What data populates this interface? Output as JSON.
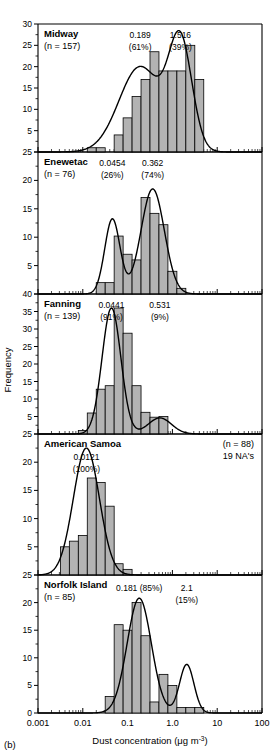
{
  "figure": {
    "label": "(b)",
    "xaxis_title_main": "Dust concentration (",
    "xaxis_title_unit": "μg m",
    "xaxis_title_sup": "-3",
    "xaxis_title_close": ")",
    "yaxis_title": "Frequency",
    "x_tick_labels": [
      "0.001",
      "0.01",
      "0.1",
      "1.0",
      "10",
      "100"
    ],
    "x_tick_values": [
      0.001,
      0.01,
      0.1,
      1.0,
      10,
      100
    ]
  },
  "chart_data": [
    {
      "type": "bar",
      "title": "Midway",
      "n_label": "(n = 157)",
      "n": 157,
      "xlabel": "Dust concentration (μg m-3)",
      "ylabel": "Frequency",
      "ylim": [
        0,
        30
      ],
      "y_ticks": [
        0,
        5,
        10,
        15,
        20,
        25,
        30
      ],
      "y_tick_labels": [
        "",
        "5",
        "10",
        "15",
        "20",
        "25",
        "30"
      ],
      "xlim_log10": [
        -3,
        2
      ],
      "xscale": "log",
      "grid": false,
      "bin_edges_log10": [
        -1.9,
        -1.7,
        -1.5,
        -1.3,
        -1.1,
        -0.9,
        -0.7,
        -0.5,
        -0.3,
        -0.1,
        0.1,
        0.3,
        0.5,
        0.7
      ],
      "values": [
        1,
        1,
        0,
        4,
        8,
        13,
        17,
        23.5,
        19,
        19,
        19,
        25,
        17,
        9
      ],
      "annotations": [
        {
          "value": "0.189",
          "percent": "(61%)",
          "at_log10": -0.72
        },
        {
          "value": "1.516",
          "percent": "(39%)",
          "at_log10": 0.18
        }
      ],
      "curve_modes": [
        {
          "center_log10": -0.72,
          "weight": 0.61,
          "sigma": 0.47,
          "peak": 20
        },
        {
          "center_log10": 0.18,
          "weight": 0.39,
          "sigma": 0.26,
          "peak": 25
        }
      ]
    },
    {
      "type": "bar",
      "title": "Enewetac",
      "n_label": "(n = 76)",
      "n": 76,
      "xlabel": "Dust concentration (μg m-3)",
      "ylabel": "Frequency",
      "ylim": [
        0,
        25
      ],
      "y_ticks": [
        0,
        5,
        10,
        15,
        20,
        25
      ],
      "y_tick_labels": [
        "",
        "5",
        "10",
        "15",
        "20",
        "25"
      ],
      "xlim_log10": [
        -3,
        2
      ],
      "xscale": "log",
      "grid": false,
      "bin_edges_log10": [
        -1.7,
        -1.5,
        -1.3,
        -1.1,
        -0.9,
        -0.7,
        -0.5,
        -0.3,
        -0.1,
        0.1,
        0.3
      ],
      "values": [
        2,
        2,
        10.2,
        7,
        6,
        17,
        14.2,
        12.2,
        4,
        1
      ],
      "annotations": [
        {
          "value": "0.0454",
          "percent": "(26%)",
          "at_log10": -1.34
        },
        {
          "value": "0.362",
          "percent": "(74%)",
          "at_log10": -0.44
        }
      ],
      "curve_modes": [
        {
          "center_log10": -1.34,
          "weight": 0.26,
          "sigma": 0.17,
          "peak": 13.2
        },
        {
          "center_log10": -0.44,
          "weight": 0.74,
          "sigma": 0.26,
          "peak": 18.5
        }
      ]
    },
    {
      "type": "bar",
      "title": "Fanning",
      "n_label": "(n = 139)",
      "n": 139,
      "xlabel": "Dust concentration (μg m-3)",
      "ylabel": "Frequency",
      "ylim": [
        0,
        40
      ],
      "y_ticks": [
        0,
        5,
        10,
        15,
        20,
        25,
        30,
        35,
        40
      ],
      "y_tick_labels": [
        "",
        "5",
        "10",
        "15",
        "20",
        "25",
        "30",
        "35",
        "40"
      ],
      "xlim_log10": [
        -3,
        2
      ],
      "xscale": "log",
      "grid": false,
      "bin_edges_log10": [
        -2.1,
        -1.9,
        -1.7,
        -1.5,
        -1.3,
        -1.1,
        -0.9,
        -0.7,
        -0.5,
        -0.3,
        -0.1
      ],
      "values": [
        1,
        6,
        12.8,
        13.8,
        36,
        28.8,
        13.8,
        6.2,
        4.8,
        5,
        3
      ],
      "annotations": [
        {
          "value": "0.0441",
          "percent": "(91%)",
          "at_log10": -1.36
        },
        {
          "value": "0.531",
          "percent": "(9%)",
          "at_log10": -0.28
        }
      ],
      "curve_modes": [
        {
          "center_log10": -1.36,
          "weight": 0.91,
          "sigma": 0.21,
          "peak": 36
        },
        {
          "center_log10": -0.28,
          "weight": 0.09,
          "sigma": 0.26,
          "peak": 4.6
        }
      ]
    },
    {
      "type": "bar",
      "title": "American Samoa",
      "n_label": "(n = 88)",
      "n": 88,
      "na_note": "19 NA's",
      "xlabel": "Dust concentration (μg m-3)",
      "ylabel": "Frequency",
      "ylim": [
        0,
        25
      ],
      "y_ticks": [
        0,
        5,
        10,
        15,
        20,
        25
      ],
      "y_tick_labels": [
        "",
        "5",
        "10",
        "15",
        "20",
        "25"
      ],
      "xlim_log10": [
        -3,
        2
      ],
      "xscale": "log",
      "grid": false,
      "bin_edges_log10": [
        -2.5,
        -2.3,
        -2.1,
        -1.9,
        -1.7,
        -1.5,
        -1.3,
        -1.1,
        -0.9
      ],
      "values": [
        5,
        6,
        7,
        17.2,
        16.4,
        12.2,
        2,
        1
      ],
      "annotations": [
        {
          "value": "0.0121",
          "percent": "(100%)",
          "at_log10": -1.92
        }
      ],
      "curve_modes": [
        {
          "center_log10": -1.92,
          "weight": 1.0,
          "sigma": 0.29,
          "peak": 22.5
        }
      ]
    },
    {
      "type": "bar",
      "title": "Norfolk Island",
      "n_label": "(n = 85)",
      "n": 85,
      "xlabel": "Dust concentration (μg m-3)",
      "ylabel": "Frequency",
      "ylim": [
        0,
        25
      ],
      "y_ticks": [
        0,
        5,
        10,
        15,
        20,
        25
      ],
      "y_tick_labels": [
        "0",
        "5",
        "10",
        "15",
        "20",
        "25"
      ],
      "xlim_log10": [
        -3,
        2
      ],
      "xscale": "log",
      "grid": false,
      "bin_edges_log10": [
        -1.5,
        -1.3,
        -1.1,
        -0.9,
        -0.7,
        -0.5,
        -0.3,
        -0.1,
        0.1,
        0.3,
        0.5,
        0.7,
        0.9,
        1.1
      ],
      "values": [
        3,
        16,
        15,
        20,
        14,
        2,
        7,
        5,
        1,
        1,
        1,
        0,
        0
      ],
      "annotations": [
        {
          "value": "0.181 (85%)",
          "percent": "",
          "at_log10": -0.74
        },
        {
          "value": "2.1",
          "percent": "(15%)",
          "at_log10": 0.32
        }
      ],
      "curve_modes": [
        {
          "center_log10": -0.74,
          "weight": 0.85,
          "sigma": 0.27,
          "peak": 20.8
        },
        {
          "center_log10": 0.32,
          "weight": 0.15,
          "sigma": 0.16,
          "peak": 8.8
        }
      ]
    }
  ]
}
